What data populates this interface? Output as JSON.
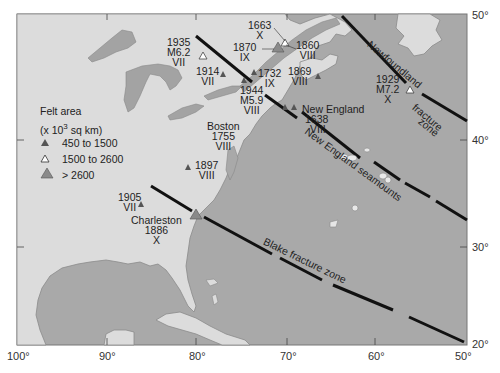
{
  "map": {
    "colors": {
      "ocean": "#a9a9a9",
      "land": "#dcdcdc",
      "lakes": "#a3a3a3",
      "fracture_line": "#111111",
      "small_triangle": "#555555",
      "large_triangle": "#8a8a8a"
    },
    "axes": {
      "longitude_ticks": [
        "100°",
        "90°",
        "80°",
        "70°",
        "60°",
        "50°"
      ],
      "latitude_ticks": [
        "50°",
        "40°",
        "30°",
        "20°"
      ]
    },
    "legend": {
      "title": "Felt area",
      "units_prefix": "(x 10",
      "units_exp": "3",
      "units_suffix": " sq km)",
      "items": [
        {
          "symbol": "small-filled-triangle",
          "label": "450 to  1500"
        },
        {
          "symbol": "open-triangle",
          "label": "1500 to  2600"
        },
        {
          "symbol": "large-gray-triangle",
          "label": "> 2600"
        }
      ]
    },
    "earthquakes": [
      {
        "year": "1663",
        "magnitude": "",
        "intensity": "X"
      },
      {
        "year": "1870",
        "magnitude": "",
        "intensity": "IX"
      },
      {
        "year": "1860",
        "magnitude": "",
        "intensity": "VIII"
      },
      {
        "year": "1935",
        "magnitude": "M6.2",
        "intensity": "VII"
      },
      {
        "year": "1914",
        "magnitude": "",
        "intensity": "VII"
      },
      {
        "year": "1732",
        "magnitude": "",
        "intensity": "IX"
      },
      {
        "year": "1869",
        "magnitude": "",
        "intensity": "VIII"
      },
      {
        "year": "1944",
        "magnitude": "M5.9",
        "intensity": "VIII"
      },
      {
        "year": "1638",
        "magnitude": "",
        "intensity": "VIII",
        "place": "New England"
      },
      {
        "year": "1755",
        "magnitude": "",
        "intensity": "VIII",
        "place": "Boston"
      },
      {
        "year": "1929",
        "magnitude": "M7.2",
        "intensity": "X"
      },
      {
        "year": "1897",
        "magnitude": "",
        "intensity": "VIII"
      },
      {
        "year": "1905",
        "magnitude": "",
        "intensity": "VII"
      },
      {
        "year": "1886",
        "magnitude": "",
        "intensity": "X",
        "place": "Charleston"
      }
    ],
    "features": {
      "newfoundland": "Newfoundland",
      "fracture": "fracture",
      "zone": "zone",
      "seamounts": "New England seamounts",
      "blake": "Blake fracture zone"
    }
  }
}
